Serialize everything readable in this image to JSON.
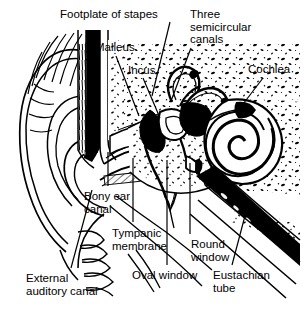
{
  "figure": {
    "style": "black and white line drawing, cross-section",
    "width": 304,
    "height": 313,
    "background_color": "#ffffff",
    "ink_color": "#000000"
  },
  "labels": [
    {
      "id": "footplate-of-stapes",
      "text": "Footplate of stapes",
      "x": 60,
      "y": 8,
      "lines": 1
    },
    {
      "id": "three-semicircular-canals",
      "text": "Three\nsemicircular\ncanals",
      "x": 190,
      "y": 8,
      "lines": 3
    },
    {
      "id": "malleus",
      "text": "Malleus",
      "x": 95,
      "y": 41,
      "lines": 1
    },
    {
      "id": "incus",
      "text": "Incus",
      "x": 128,
      "y": 64,
      "lines": 1
    },
    {
      "id": "cochlea",
      "text": "Cochlea",
      "x": 248,
      "y": 63,
      "lines": 1
    },
    {
      "id": "bony-ear-canal",
      "text": "Bony ear\ncanal",
      "x": 84,
      "y": 190,
      "lines": 2
    },
    {
      "id": "tympanic-membrane",
      "text": "Tympanic\nmembrane",
      "x": 112,
      "y": 227,
      "lines": 2
    },
    {
      "id": "round-window",
      "text": "Round\nwindow",
      "x": 191,
      "y": 238,
      "lines": 2
    },
    {
      "id": "oval-window",
      "text": "Oval window",
      "x": 132,
      "y": 269,
      "lines": 1
    },
    {
      "id": "eustachian-tube",
      "text": "Eustachian\ntube",
      "x": 213,
      "y": 269,
      "lines": 2
    },
    {
      "id": "external-auditory-canal",
      "text": "External\nauditory canal",
      "x": 26,
      "y": 272,
      "lines": 2
    }
  ],
  "leader_lines": [
    {
      "id": "leader-footplate-of-stapes",
      "from": [
        170,
        22
      ],
      "to": [
        152,
        96
      ]
    },
    {
      "id": "leader-three-semicircular-canals",
      "from": [
        191,
        48
      ],
      "to": [
        171,
        101
      ]
    },
    {
      "id": "leader-malleus",
      "from": [
        116,
        56
      ],
      "to": [
        139,
        116
      ]
    },
    {
      "id": "leader-incus",
      "from": [
        143,
        78
      ],
      "to": [
        160,
        118
      ]
    },
    {
      "id": "leader-cochlea",
      "from": [
        263,
        78
      ],
      "to": [
        240,
        108
      ]
    },
    {
      "id": "leader-bony-ear-canal",
      "from": [
        108,
        186
      ],
      "to": [
        108,
        152
      ]
    },
    {
      "id": "leader-tympanic-membrane",
      "from": [
        133,
        222
      ],
      "to": [
        133,
        158
      ]
    },
    {
      "id": "leader-round-window",
      "from": [
        190,
        234
      ],
      "to": [
        190,
        163
      ]
    },
    {
      "id": "leader-oval-window",
      "from": [
        167,
        265
      ],
      "to": [
        167,
        160
      ]
    },
    {
      "id": "leader-eustachian-tube",
      "from": [
        232,
        265
      ],
      "to": [
        246,
        212
      ]
    },
    {
      "id": "leader-external-auditory-canal",
      "from": [
        71,
        268
      ],
      "to": [
        92,
        190
      ]
    }
  ],
  "structures": [
    {
      "id": "pinna",
      "name": "Pinna (auricle)"
    },
    {
      "id": "external-auditory-canal",
      "name": "External auditory canal"
    },
    {
      "id": "tympanic-membrane",
      "name": "Tympanic membrane (eardrum)"
    },
    {
      "id": "malleus",
      "name": "Malleus"
    },
    {
      "id": "incus",
      "name": "Incus"
    },
    {
      "id": "stapes",
      "name": "Stapes with footplate"
    },
    {
      "id": "semicircular-canals",
      "name": "Three semicircular canals"
    },
    {
      "id": "cochlea",
      "name": "Cochlea"
    },
    {
      "id": "oval-window",
      "name": "Oval window"
    },
    {
      "id": "round-window",
      "name": "Round window"
    },
    {
      "id": "eustachian-tube",
      "name": "Eustachian tube"
    },
    {
      "id": "temporal-bone",
      "name": "Temporal bone (stippled)"
    }
  ]
}
